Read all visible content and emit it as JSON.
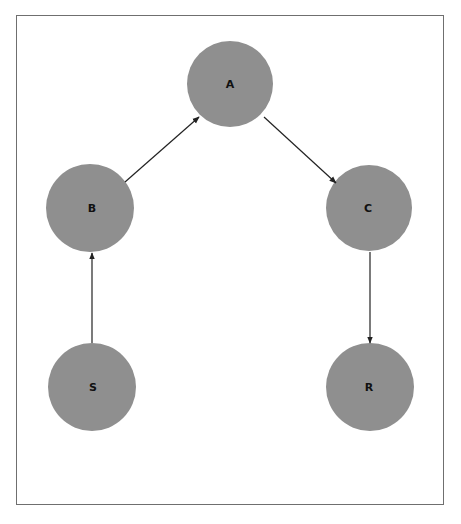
{
  "diagram": {
    "type": "directed-graph",
    "node_color": "#8f8f8f",
    "edge_color": "#222222",
    "nodes": [
      {
        "id": "A",
        "label": "A",
        "cx": 230,
        "cy": 84,
        "r": 43
      },
      {
        "id": "B",
        "label": "B",
        "cx": 90,
        "cy": 208,
        "r": 44
      },
      {
        "id": "C",
        "label": "C",
        "cx": 369,
        "cy": 208,
        "r": 43
      },
      {
        "id": "S",
        "label": "S",
        "cx": 92,
        "cy": 387,
        "r": 44
      },
      {
        "id": "R",
        "label": "R",
        "cx": 370,
        "cy": 387,
        "r": 44
      }
    ],
    "edges": [
      {
        "from": "S",
        "to": "B"
      },
      {
        "from": "B",
        "to": "A"
      },
      {
        "from": "A",
        "to": "C"
      },
      {
        "from": "C",
        "to": "R"
      }
    ]
  }
}
